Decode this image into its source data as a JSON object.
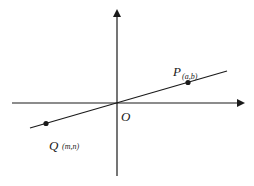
{
  "diagram": {
    "type": "coordinate-plane",
    "axes": {
      "origin_label": "O"
    },
    "points": [
      {
        "name": "P",
        "coords": "(a,b)"
      },
      {
        "name": "Q",
        "coords": "(m,n)"
      }
    ],
    "colors": {
      "ink": "#1a1a1a",
      "background": "#ffffff"
    }
  }
}
